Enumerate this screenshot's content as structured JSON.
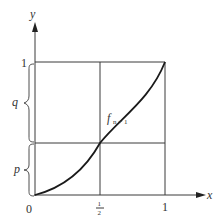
{
  "figure": {
    "axes": {
      "x_label": "x",
      "y_label": "y",
      "origin_label": "0",
      "x_ticks": [
        {
          "label_num": "1",
          "label_den": "2",
          "value": 0.5
        },
        {
          "label": "1",
          "value": 1
        }
      ],
      "y_ticks": [
        {
          "label": "1",
          "value": 1
        }
      ]
    },
    "braces": [
      {
        "label": "p",
        "from": 0,
        "to": 0.5
      },
      {
        "label": "q",
        "from": 0.5,
        "to": 1
      }
    ],
    "curve": {
      "label_main": "f",
      "label_sub": "n + 1",
      "passes_through": [
        [
          0,
          0
        ],
        [
          0.5,
          0.5
        ],
        [
          1,
          1
        ]
      ]
    },
    "grid": {
      "vertical": [
        0.5,
        1
      ],
      "horizontal": [
        0.5,
        1
      ]
    }
  }
}
